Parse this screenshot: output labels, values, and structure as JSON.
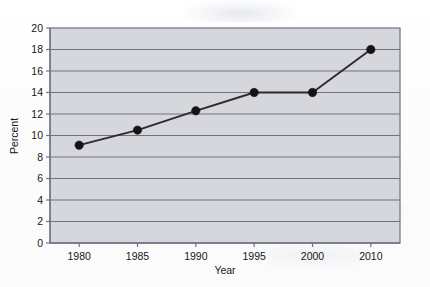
{
  "chart_data": {
    "type": "line",
    "title": "",
    "xlabel": "Year",
    "ylabel": "Percent",
    "categories": [
      "1980",
      "1985",
      "1990",
      "1995",
      "2000",
      "2010"
    ],
    "values": [
      9.1,
      10.5,
      12.3,
      14.0,
      14.0,
      18.0
    ],
    "series": [
      {
        "name": "Percent",
        "values": [
          9.1,
          10.5,
          12.3,
          14.0,
          14.0,
          18.0
        ]
      }
    ],
    "ylim": [
      0,
      20
    ],
    "ytick_step": 2,
    "yticks": [
      "0",
      "2",
      "4",
      "6",
      "8",
      "10",
      "12",
      "14",
      "16",
      "18",
      "20"
    ],
    "xticks": [
      "1980",
      "1985",
      "1990",
      "1995",
      "2000",
      "2010"
    ],
    "grid": "horizontal",
    "legend": "none",
    "marker": "filled-circle",
    "colors": {
      "plot_background": "#d6d7dd",
      "gridline": "#70737f",
      "axis": "#6f7280",
      "line": "#2b2b2f",
      "marker": "#141416",
      "text": "#171717",
      "page_background": "#fdfdfd"
    }
  }
}
